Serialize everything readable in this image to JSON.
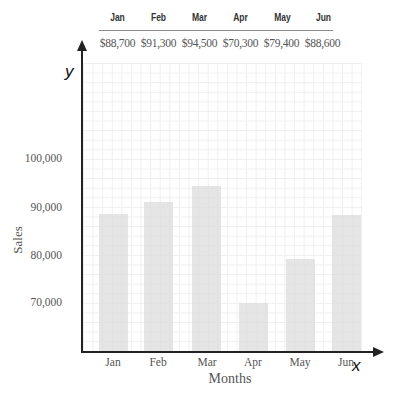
{
  "header_table": {
    "months": [
      "Jan",
      "Feb",
      "Mar",
      "Apr",
      "May",
      "Jun"
    ],
    "values": [
      "$88,700",
      "$91,300",
      "$94,500",
      "$70,300",
      "$79,400",
      "$88,600"
    ]
  },
  "axes": {
    "y_symbol": "y",
    "x_symbol": "x",
    "y_title": "Sales",
    "x_title": "Months",
    "y_ticks": [
      "100,000",
      "90,000",
      "80,000",
      "70,000"
    ]
  },
  "colors": {
    "bar": "#dcdcdc",
    "axis": "#222222",
    "grid": "#efefef",
    "text": "#555555"
  },
  "chart_data": {
    "type": "bar",
    "title": "",
    "categories": [
      "Jan",
      "Feb",
      "Mar",
      "Apr",
      "May",
      "Jun"
    ],
    "values": [
      88700,
      91300,
      94500,
      70300,
      79400,
      88600
    ],
    "xlabel": "Months",
    "ylabel": "Sales",
    "ylim": [
      60000,
      120000
    ],
    "yticks": [
      70000,
      80000,
      90000,
      100000
    ],
    "grid": true,
    "legend": null,
    "annotations": {
      "table_above_chart": {
        "Jan": "$88,700",
        "Feb": "$91,300",
        "Mar": "$94,500",
        "Apr": "$70,300",
        "May": "$79,400",
        "Jun": "$88,600"
      }
    }
  }
}
